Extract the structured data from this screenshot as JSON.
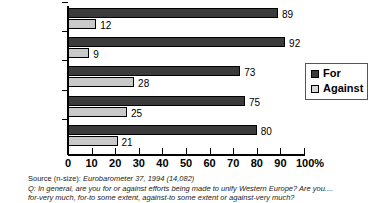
{
  "chart_data": {
    "type": "bar",
    "orientation": "horizontal",
    "title": "",
    "xlabel": "",
    "ylabel": "",
    "xlim": [
      0,
      100
    ],
    "xticks": [
      0,
      10,
      20,
      30,
      40,
      50,
      60,
      70,
      80,
      90,
      100
    ],
    "xtick_labels": [
      "0",
      "10",
      "20",
      "30",
      "40",
      "50",
      "60",
      "70",
      "80",
      "90",
      "100%"
    ],
    "grid": false,
    "legend_position": "right",
    "categories": [
      "Catholic",
      "Orthodox",
      "Protestant",
      "Other*",
      "None"
    ],
    "series": [
      {
        "name": "For",
        "color": "#3b3b3b",
        "values": [
          89,
          92,
          73,
          75,
          80
        ]
      },
      {
        "name": "Against",
        "color": "#c9c9c9",
        "values": [
          12,
          9,
          28,
          25,
          21
        ]
      }
    ]
  },
  "legend": {
    "items": [
      {
        "label": "For",
        "color": "#3b3b3b"
      },
      {
        "label": "Against",
        "color": "#d8d8d8"
      }
    ]
  },
  "footnotes": {
    "source_label": "Source (n-size): ",
    "source_value": "Eurobarometer 37, 1994 (14,082)",
    "question_line1": "Q: In general, are you for or against efforts being made to unify Western Europe? Are you....",
    "question_line2": "for-very much, for-to some extent, against-to some extent or against-very much?"
  }
}
